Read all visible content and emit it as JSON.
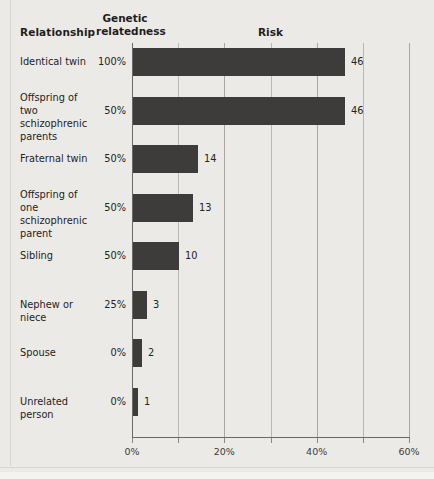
{
  "headers": {
    "relationship": "Relationship",
    "genetic_line1": "Genetic",
    "genetic_line2": "relatedness",
    "risk": "Risk"
  },
  "chart_data": {
    "type": "bar",
    "orientation": "horizontal",
    "title": "Risk",
    "xlabel": "",
    "ylabel": "Relationship",
    "xlim": [
      0,
      60
    ],
    "xtick_labels": [
      "0%",
      "20%",
      "40%",
      "60%"
    ],
    "xtick_values": [
      0,
      20,
      40,
      60
    ],
    "minor_gridlines": [
      10,
      30,
      50
    ],
    "grid": true,
    "legend": "none",
    "value_suffix": "%",
    "categories": [
      "Identical twin",
      "Offspring of two schizophrenic parents",
      "Fraternal twin",
      "Offspring of one schizophrenic parent",
      "Sibling",
      "Nephew or niece",
      "Spouse",
      "Unrelated person"
    ],
    "values": [
      46,
      46,
      14,
      13,
      10,
      3,
      2,
      1
    ],
    "genetic_relatedness": [
      "100%",
      "50%",
      "50%",
      "50%",
      "50%",
      "25%",
      "0%",
      "0%"
    ],
    "rows": [
      {
        "label_lines": [
          "Identical twin"
        ],
        "relatedness": "100%",
        "risk": 46,
        "risk_label": "46"
      },
      {
        "label_lines": [
          "Offspring of two",
          "schizophrenic",
          "parents"
        ],
        "relatedness": "50%",
        "risk": 46,
        "risk_label": "46"
      },
      {
        "label_lines": [
          "Fraternal twin"
        ],
        "relatedness": "50%",
        "risk": 14,
        "risk_label": "14"
      },
      {
        "label_lines": [
          "Offspring of one",
          "schizophrenic",
          "parent"
        ],
        "relatedness": "50%",
        "risk": 13,
        "risk_label": "13"
      },
      {
        "label_lines": [
          "Sibling"
        ],
        "relatedness": "50%",
        "risk": 10,
        "risk_label": "10"
      },
      {
        "label_lines": [
          "Nephew or niece"
        ],
        "relatedness": "25%",
        "risk": 3,
        "risk_label": "3"
      },
      {
        "label_lines": [
          "Spouse"
        ],
        "relatedness": "0%",
        "risk": 2,
        "risk_label": "2"
      },
      {
        "label_lines": [
          "Unrelated person"
        ],
        "relatedness": "0%",
        "risk": 1,
        "risk_label": "1"
      }
    ]
  },
  "colors": {
    "bar": "#3d3c3a",
    "background": "#eceae7",
    "gridline": "#bab8b5",
    "axis": "#6b6966",
    "text": "#232323"
  }
}
